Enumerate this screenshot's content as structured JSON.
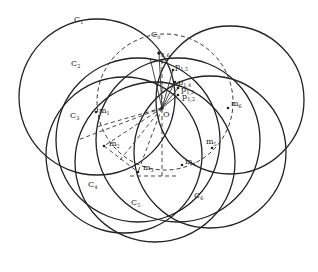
{
  "diagram": {
    "type": "geometric-construction",
    "origin": {
      "label": "O",
      "x": 162,
      "y": 108
    },
    "circles": [
      {
        "id": "C0",
        "label": "C",
        "sub": "0",
        "cx": 165,
        "cy": 102,
        "r": 68,
        "style": "dashed",
        "lx": 152,
        "ly": 36
      },
      {
        "id": "C1",
        "label": "C",
        "sub": "1",
        "cx": 97,
        "cy": 97,
        "r": 78,
        "style": "solid",
        "lx": 76,
        "ly": 22
      },
      {
        "id": "C2",
        "label": "C",
        "sub": "2",
        "cx": 230,
        "cy": 100,
        "r": 74,
        "style": "solid",
        "lx": 71,
        "ly": 65
      },
      {
        "id": "C3",
        "label": "C",
        "sub": "3",
        "cx": 117,
        "cy": 150,
        "r": 72,
        "style": "solid",
        "lx": 72,
        "ly": 117
      },
      {
        "id": "C4",
        "label": "C",
        "sub": "4",
        "cx": 150,
        "cy": 174,
        "r": 72,
        "style": "solid",
        "lx": 89,
        "ly": 191
      },
      {
        "id": "C5",
        "label": "C",
        "sub": "5",
        "cx": 208,
        "cy": 150,
        "r": 74,
        "style": "solid",
        "lx": 233,
        "ly": 198
      },
      {
        "id": "C6",
        "label": "C",
        "sub": "6",
        "cx": 182,
        "cy": 172,
        "r": 74,
        "style": "solid",
        "lx": 0,
        "ly": 0
      }
    ],
    "labels": {
      "C0": "C0",
      "C1": "C1",
      "C2": "C2",
      "C3": "C3",
      "C4": "C4",
      "C5": "C5",
      "C6": "C6",
      "O": "O"
    },
    "midpoints": [
      {
        "label": "m",
        "sub": "1",
        "x": 154,
        "y": 70,
        "lx": 100,
        "ly": 111
      },
      {
        "label": "m",
        "sub": "2",
        "x": 104,
        "y": 146,
        "lx": 111,
        "ly": 146
      },
      {
        "label": "m",
        "sub": "3",
        "x": 138,
        "y": 172,
        "lx": 145,
        "ly": 170
      },
      {
        "label": "m",
        "sub": "4",
        "x": 182,
        "y": 165,
        "lx": 186,
        "ly": 162
      },
      {
        "label": "m",
        "sub": "5",
        "x": 212,
        "y": 148,
        "lx": 206,
        "ly": 146
      },
      {
        "label": "m",
        "sub": "6",
        "x": 228,
        "y": 108,
        "lx": 232,
        "ly": 106
      }
    ],
    "points": [
      {
        "label": "p",
        "sub": "1,6",
        "x": 159,
        "y": 53,
        "lx": 162,
        "ly": 56
      },
      {
        "label": "p",
        "sub": "1,5",
        "x": 173,
        "y": 70,
        "lx": 176,
        "ly": 67
      },
      {
        "label": "p",
        "sub": "1,4",
        "x": 175,
        "y": 82,
        "lx": 179,
        "ly": 83
      },
      {
        "label": "p",
        "sub": "1,3",
        "x": 178,
        "y": 88,
        "lx": 182,
        "ly": 91
      },
      {
        "label": "p",
        "sub": "1,2",
        "x": 178,
        "y": 95,
        "lx": 184,
        "ly": 99
      }
    ]
  }
}
